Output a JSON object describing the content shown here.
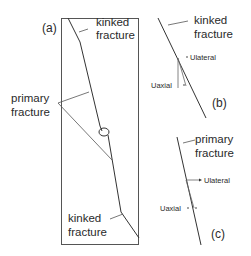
{
  "figure": {
    "panels": {
      "a": {
        "label": "(a)",
        "top_label_line1": "kinked",
        "top_label_line2": "fracture",
        "mid_label_line1": "primary",
        "mid_label_line2": "fracture",
        "bottom_label_line1": "kinked",
        "bottom_label_line2": "fracture"
      },
      "b": {
        "label": "(b)",
        "title_line1": "kinked",
        "title_line2": "fracture",
        "lateral": "Ulateral",
        "axial": "Uaxial"
      },
      "c": {
        "label": "(c)",
        "title_line1": "primary",
        "title_line2": "fracture",
        "lateral": "Ulateral",
        "axial": "Uaxial"
      }
    },
    "colors": {
      "line": "#3a3a3a",
      "text": "#2a2a2a",
      "background": "#ffffff"
    }
  }
}
